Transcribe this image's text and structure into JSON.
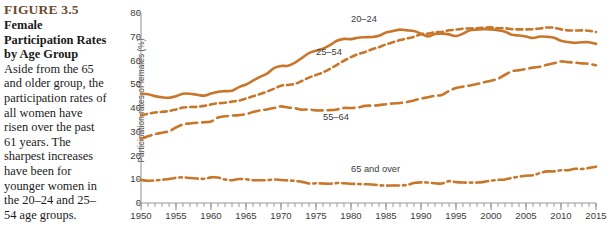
{
  "caption": {
    "figure_number": "FIGURE 3.5",
    "title": "Female Participation Rates by Age Group",
    "body": "Aside from the 65 and older group, the participation rates of all women have risen over the past 61 years. The sharpest increases have been for younger women in the 20–24 and 25–54 age groups."
  },
  "colors": {
    "line": "#C8762A",
    "axis": "#9a9a9a",
    "tick_text": "#3b3b3b",
    "figure_number": "#6b4a2f"
  },
  "chart_data": {
    "type": "line",
    "title": "Female Participation Rates by Age Group",
    "xlabel": "",
    "ylabel": "Participation rates of females (%)",
    "xlim": [
      1950,
      2015
    ],
    "ylim": [
      0,
      80
    ],
    "ytick_labels": [
      "0",
      "10",
      "20",
      "30",
      "40",
      "50",
      "60",
      "70",
      "80"
    ],
    "yticks": [
      0,
      10,
      20,
      30,
      40,
      50,
      60,
      70,
      80
    ],
    "xtick_labels": [
      "1950",
      "1955",
      "1960",
      "1965",
      "1970",
      "1975",
      "1980",
      "1985",
      "1990",
      "1995",
      "2000",
      "2005",
      "2010",
      "2015"
    ],
    "xticks": [
      1950,
      1955,
      1960,
      1965,
      1970,
      1975,
      1980,
      1985,
      1990,
      1995,
      2000,
      2005,
      2010,
      2015
    ],
    "minor_xtick_step": 1,
    "grid": false,
    "legend": "inline-annotations",
    "x": [
      1950,
      1951,
      1952,
      1953,
      1954,
      1955,
      1956,
      1957,
      1958,
      1959,
      1960,
      1961,
      1962,
      1963,
      1964,
      1965,
      1966,
      1967,
      1968,
      1969,
      1970,
      1971,
      1972,
      1973,
      1974,
      1975,
      1976,
      1977,
      1978,
      1979,
      1980,
      1981,
      1982,
      1983,
      1984,
      1985,
      1986,
      1987,
      1988,
      1989,
      1990,
      1991,
      1992,
      1993,
      1994,
      1995,
      1996,
      1997,
      1998,
      1999,
      2000,
      2001,
      2002,
      2003,
      2004,
      2005,
      2006,
      2007,
      2008,
      2009,
      2010,
      2011,
      2012,
      2013,
      2014,
      2015
    ],
    "series": [
      {
        "name": "20–24",
        "style": "solid",
        "label_x": 1982,
        "label_y": 77,
        "values": [
          46.0,
          45.8,
          45.0,
          44.5,
          44.3,
          45.0,
          46.0,
          46.0,
          45.6,
          45.2,
          46.1,
          46.8,
          47.1,
          47.3,
          48.8,
          49.9,
          51.5,
          53.1,
          54.5,
          56.8,
          57.7,
          57.8,
          59.1,
          61.1,
          63.1,
          64.1,
          65.0,
          66.5,
          68.3,
          69.1,
          69.0,
          69.6,
          69.8,
          69.9,
          70.4,
          71.8,
          72.4,
          73.0,
          72.7,
          72.4,
          71.3,
          70.1,
          71.2,
          71.3,
          71.0,
          70.3,
          71.3,
          72.7,
          73.0,
          73.2,
          73.1,
          72.7,
          72.1,
          70.8,
          70.5,
          70.1,
          69.5,
          70.1,
          70.0,
          69.6,
          68.3,
          67.8,
          67.4,
          67.7,
          67.7,
          67.0
        ]
      },
      {
        "name": "25–54",
        "style": "dashed",
        "label_x": 1977,
        "label_y": 63,
        "values": [
          37.0,
          37.6,
          38.1,
          38.4,
          38.7,
          39.4,
          40.2,
          40.4,
          40.5,
          40.9,
          41.5,
          42.0,
          42.2,
          42.7,
          43.1,
          44.0,
          44.9,
          45.9,
          46.9,
          48.1,
          49.4,
          49.7,
          50.2,
          51.4,
          52.8,
          53.9,
          55.0,
          56.5,
          58.2,
          59.9,
          61.4,
          62.7,
          63.6,
          64.7,
          65.6,
          66.8,
          67.7,
          68.6,
          69.3,
          70.0,
          71.1,
          71.3,
          71.9,
          72.0,
          72.7,
          73.0,
          73.4,
          73.5,
          73.6,
          73.8,
          74.0,
          73.6,
          73.6,
          73.2,
          73.1,
          73.1,
          73.2,
          73.5,
          73.9,
          73.8,
          73.1,
          72.7,
          72.6,
          72.7,
          72.5,
          72.0
        ]
      },
      {
        "name": "55–64",
        "style": "longdash",
        "label_x": 1978,
        "label_y": 36,
        "values": [
          27.0,
          28.1,
          29.0,
          29.6,
          30.2,
          31.8,
          33.1,
          33.5,
          33.8,
          34.0,
          34.3,
          36.0,
          36.5,
          36.8,
          37.0,
          37.4,
          38.3,
          39.0,
          39.4,
          40.0,
          40.7,
          40.2,
          39.9,
          39.3,
          39.4,
          39.0,
          39.0,
          39.1,
          39.4,
          40.0,
          40.0,
          40.2,
          40.9,
          41.0,
          41.2,
          41.6,
          41.9,
          42.1,
          42.5,
          43.2,
          44.0,
          44.5,
          45.2,
          45.5,
          47.2,
          48.4,
          49.0,
          49.5,
          50.1,
          50.8,
          51.5,
          52.3,
          54.0,
          55.5,
          55.9,
          56.4,
          57.0,
          57.4,
          58.2,
          58.8,
          59.6,
          59.3,
          59.1,
          58.8,
          58.6,
          58.0
        ]
      },
      {
        "name": "65 and over",
        "style": "dashdot",
        "label_x": 1982,
        "label_y": 14,
        "values": [
          9.7,
          9.4,
          9.5,
          9.8,
          10.1,
          10.6,
          10.8,
          10.5,
          10.3,
          10.2,
          10.8,
          10.7,
          9.9,
          9.6,
          10.1,
          10.0,
          9.6,
          9.6,
          9.6,
          9.9,
          9.7,
          9.5,
          9.3,
          8.9,
          8.2,
          8.3,
          8.2,
          8.1,
          8.4,
          8.3,
          8.1,
          8.0,
          7.9,
          7.8,
          7.5,
          7.3,
          7.4,
          7.4,
          7.6,
          8.4,
          8.7,
          8.6,
          8.3,
          8.2,
          9.2,
          8.8,
          8.6,
          8.6,
          8.6,
          8.9,
          9.4,
          9.7,
          9.9,
          10.6,
          11.1,
          11.5,
          11.7,
          12.6,
          13.3,
          13.3,
          13.8,
          13.8,
          14.4,
          14.3,
          14.8,
          15.3
        ]
      }
    ]
  }
}
